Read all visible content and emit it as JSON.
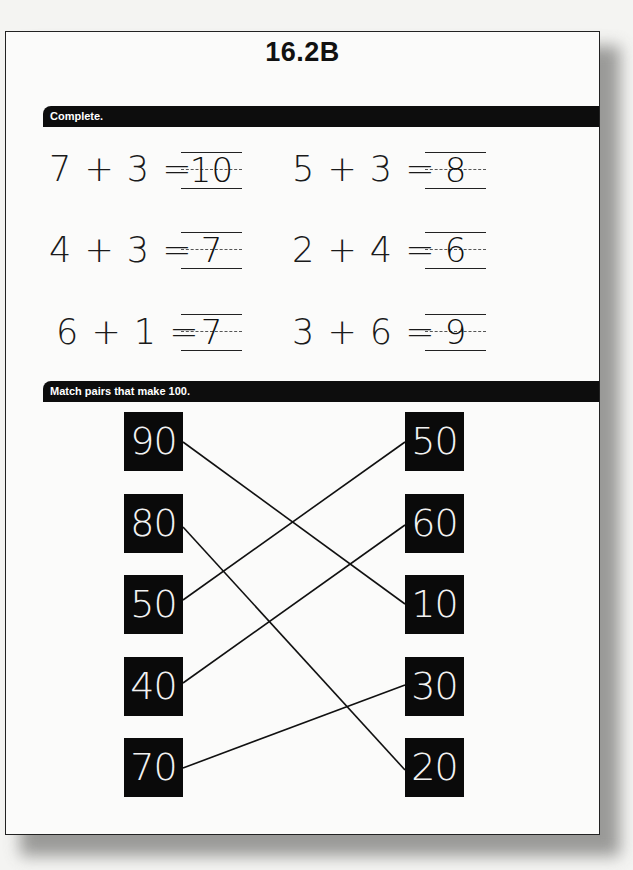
{
  "title": "16.2B",
  "sections": {
    "complete": {
      "label": "Complete.",
      "equations": [
        {
          "expr": "7 + 3 =",
          "answer": "10"
        },
        {
          "expr": "5 + 3 =",
          "answer": "8"
        },
        {
          "expr": "4 + 3 =",
          "answer": "7"
        },
        {
          "expr": "2 + 4 =",
          "answer": "6"
        },
        {
          "expr": "6 + 1 =",
          "answer": "7"
        },
        {
          "expr": "3 + 6 =",
          "answer": "9"
        }
      ]
    },
    "match": {
      "label": "Match pairs that make 100.",
      "left": [
        "90",
        "80",
        "50",
        "40",
        "70"
      ],
      "right": [
        "50",
        "60",
        "10",
        "30",
        "20"
      ],
      "pairs": [
        {
          "left": "90",
          "right": "10"
        },
        {
          "left": "80",
          "right": "20"
        },
        {
          "left": "50",
          "right": "50"
        },
        {
          "left": "40",
          "right": "60"
        },
        {
          "left": "70",
          "right": "30"
        }
      ]
    }
  }
}
